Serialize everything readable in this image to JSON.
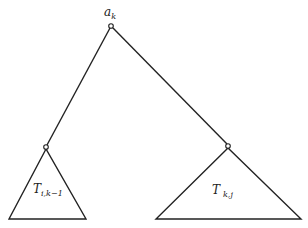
{
  "diagram": {
    "root": {
      "label": "a",
      "subscript": "k",
      "x": 111,
      "y": 26
    },
    "left_node": {
      "x": 46,
      "y": 147
    },
    "right_node": {
      "x": 228,
      "y": 146
    },
    "left_subtree": {
      "label": "T",
      "subscript": "i,k−1",
      "base_left": 9,
      "base_right": 86,
      "base_y": 219
    },
    "right_subtree": {
      "label": "T",
      "subscript": "k,j",
      "base_left": 156,
      "base_right": 301,
      "base_y": 219
    },
    "stroke_color": "#222222"
  }
}
